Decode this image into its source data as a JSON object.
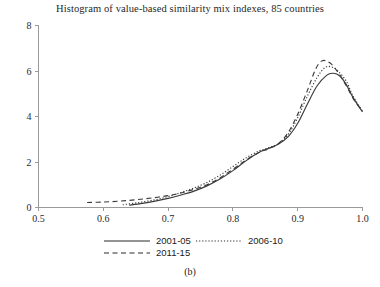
{
  "chart_data": {
    "type": "line",
    "title": "Histogram of value-based similarity mix indexes, 85 countries",
    "caption": "(b)",
    "xlabel": "",
    "ylabel": "",
    "xlim": [
      0.5,
      1.0
    ],
    "ylim": [
      0,
      8
    ],
    "grid": false,
    "legend_position": "bottom",
    "xticks": [
      "0.5",
      "0.6",
      "0.7",
      "0.8",
      "0.9",
      "1.0"
    ],
    "xtick_values": [
      0.5,
      0.6,
      0.7,
      0.8,
      0.9,
      1.0
    ],
    "yticks": [
      "0",
      "2",
      "4",
      "6",
      "8"
    ],
    "ytick_values": [
      0,
      2,
      4,
      6,
      8
    ],
    "series": [
      {
        "name": "2001-05",
        "style": "solid",
        "x": [
          0.64,
          0.66,
          0.68,
          0.7,
          0.72,
          0.74,
          0.76,
          0.78,
          0.8,
          0.82,
          0.84,
          0.855,
          0.87,
          0.885,
          0.9,
          0.915,
          0.93,
          0.945,
          0.955,
          0.965,
          0.975,
          0.985,
          1.0
        ],
        "y": [
          0.1,
          0.18,
          0.28,
          0.4,
          0.55,
          0.72,
          0.95,
          1.25,
          1.62,
          2.05,
          2.42,
          2.6,
          2.78,
          3.1,
          3.7,
          4.55,
          5.35,
          5.82,
          5.9,
          5.78,
          5.4,
          4.85,
          4.2
        ]
      },
      {
        "name": "2006-10",
        "style": "dotted",
        "x": [
          0.63,
          0.655,
          0.68,
          0.7,
          0.72,
          0.74,
          0.76,
          0.78,
          0.8,
          0.82,
          0.84,
          0.855,
          0.87,
          0.885,
          0.9,
          0.915,
          0.93,
          0.942,
          0.952,
          0.962,
          0.975,
          0.985,
          1.0
        ],
        "y": [
          0.12,
          0.22,
          0.34,
          0.48,
          0.66,
          0.86,
          1.1,
          1.42,
          1.8,
          2.18,
          2.48,
          2.62,
          2.8,
          3.2,
          3.95,
          4.9,
          5.72,
          6.15,
          6.18,
          6.0,
          5.55,
          4.92,
          4.22
        ]
      },
      {
        "name": "2011-15",
        "style": "dashed",
        "x": [
          0.575,
          0.6,
          0.625,
          0.65,
          0.675,
          0.7,
          0.72,
          0.74,
          0.76,
          0.78,
          0.8,
          0.82,
          0.84,
          0.855,
          0.87,
          0.885,
          0.9,
          0.915,
          0.928,
          0.938,
          0.95,
          0.962,
          0.975,
          0.988,
          1.0
        ],
        "y": [
          0.22,
          0.24,
          0.28,
          0.34,
          0.42,
          0.52,
          0.64,
          0.8,
          1.0,
          1.3,
          1.68,
          2.08,
          2.42,
          2.58,
          2.8,
          3.28,
          4.1,
          5.15,
          6.1,
          6.45,
          6.35,
          5.95,
          5.35,
          4.68,
          4.25
        ]
      }
    ],
    "legend": [
      {
        "label": "2001-05",
        "style": "solid"
      },
      {
        "label": "2006-10",
        "style": "dotted"
      },
      {
        "label": "2011-15",
        "style": "dashed"
      }
    ]
  }
}
